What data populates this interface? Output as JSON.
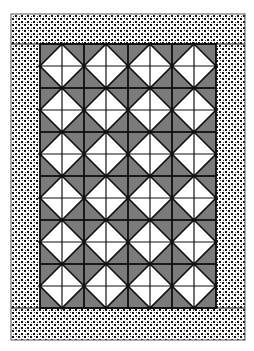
{
  "quilt": {
    "canvas": {
      "width": 254,
      "height": 351
    },
    "outer_border": {
      "x": 11,
      "y": 14,
      "width": 234,
      "height": 326
    },
    "border_width": {
      "top": 30,
      "bottom": 29,
      "left": 29,
      "right": 28
    },
    "panel": {
      "x": 40,
      "y": 44,
      "cols": 4,
      "rows": 6,
      "block_size": 44
    },
    "block_design": "square-in-a-square (white diamond on gray, quartered by midlines)",
    "colors": {
      "background": "#ffffff",
      "diamond": "#ffffff",
      "corner_triangles": "#7b7b7b",
      "lines": "#111111",
      "border_print_dots": "#111111",
      "border_print_ground": "#ffffff"
    },
    "border_fabric": "black-and-white dotted print",
    "tip_dots": true
  }
}
